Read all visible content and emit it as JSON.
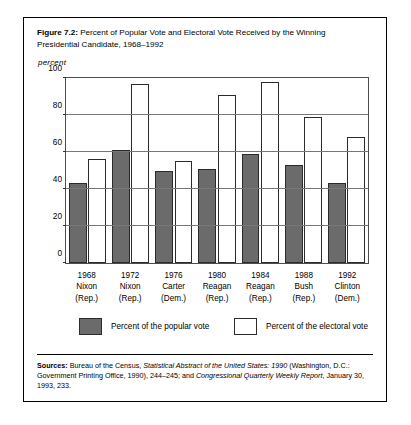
{
  "figure": {
    "label": "Figure 7.2:",
    "caption": "Percent of Popular Vote and Electoral Vote Received by the Winning Presidential Candidate, 1968–1992"
  },
  "legend": {
    "popular_label": "Percent of the popular vote",
    "electoral_label": "Percent of the electoral vote"
  },
  "sources": {
    "label": "Sources:",
    "part1": " Bureau of the Census, ",
    "italic1": "Statistical Abstract of the United States: 1990",
    "part2": " (Washington, D.C.: Government Printing Office, 1990), 244–245; and ",
    "italic2": "Congressional Quarterly Weekly Report",
    "part3": ", January 30, 1993, 233."
  },
  "colors": {
    "popular_bar": "#6b6b6b",
    "electoral_bar": "#ffffff",
    "bar_outline": "#2b2b2b",
    "gridline": "#777777",
    "frame": "#000000"
  },
  "chart_data": {
    "type": "bar",
    "title": "Percent of Popular Vote and Electoral Vote Received by the Winning Presidential Candidate, 1968–1992",
    "xlabel": "",
    "ylabel": "percent",
    "ylim": [
      0,
      100
    ],
    "yticks": [
      0,
      20,
      40,
      60,
      80,
      100
    ],
    "grid": true,
    "legend_position": "below",
    "categories": [
      {
        "year": "1968",
        "name": "Nixon",
        "party": "(Rep.)"
      },
      {
        "year": "1972",
        "name": "Nixon",
        "party": "(Rep.)"
      },
      {
        "year": "1976",
        "name": "Carter",
        "party": "(Dem.)"
      },
      {
        "year": "1980",
        "name": "Reagan",
        "party": "(Rep.)"
      },
      {
        "year": "1984",
        "name": "Reagan",
        "party": "(Rep.)"
      },
      {
        "year": "1988",
        "name": "Bush",
        "party": "(Rep.)"
      },
      {
        "year": "1992",
        "name": "Clinton",
        "party": "(Dem.)"
      }
    ],
    "series": [
      {
        "name": "Percent of the popular vote",
        "values": [
          43,
          61,
          50,
          51,
          59,
          53,
          43
        ]
      },
      {
        "name": "Percent of the electoral vote",
        "values": [
          56,
          97,
          55,
          91,
          98,
          79,
          68
        ]
      }
    ]
  }
}
